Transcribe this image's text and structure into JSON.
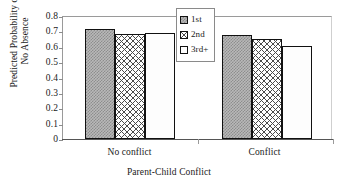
{
  "chart_data": {
    "type": "bar",
    "title": "",
    "xlabel": "Parent-Child Conflict",
    "ylabel_lines": [
      "Predicted Probability of",
      "No Absence"
    ],
    "ylabel": "Predicted Probability of No Absence",
    "categories": [
      "No conflict",
      "Conflict"
    ],
    "series": [
      {
        "name": "1st",
        "values": [
          0.715,
          0.675
        ]
      },
      {
        "name": "2nd",
        "values": [
          0.682,
          0.65
        ]
      },
      {
        "name": "3rd+",
        "values": [
          0.69,
          0.605
        ]
      }
    ],
    "ylim": [
      0,
      0.8
    ],
    "ytick_labels": [
      "0.8",
      "0.7",
      "0.6",
      "0.5",
      "0.4",
      "0.3",
      "0.2",
      "0.1",
      "0"
    ],
    "ytick_values": [
      0.8,
      0.7,
      0.6,
      0.5,
      0.4,
      0.3,
      0.2,
      0.1,
      0
    ],
    "grid": false,
    "legend_position": "top-center",
    "legend_entries": [
      "1st",
      "2nd",
      "3rd+"
    ],
    "colors": {
      "series_1_fill": "#b9b9b9",
      "series_2_fill": "#ffffff",
      "series_3_fill": "#fdfdfd",
      "bar_outline": "#111111",
      "axis": "#8a8a8a",
      "text": "#1a1a1a"
    }
  }
}
